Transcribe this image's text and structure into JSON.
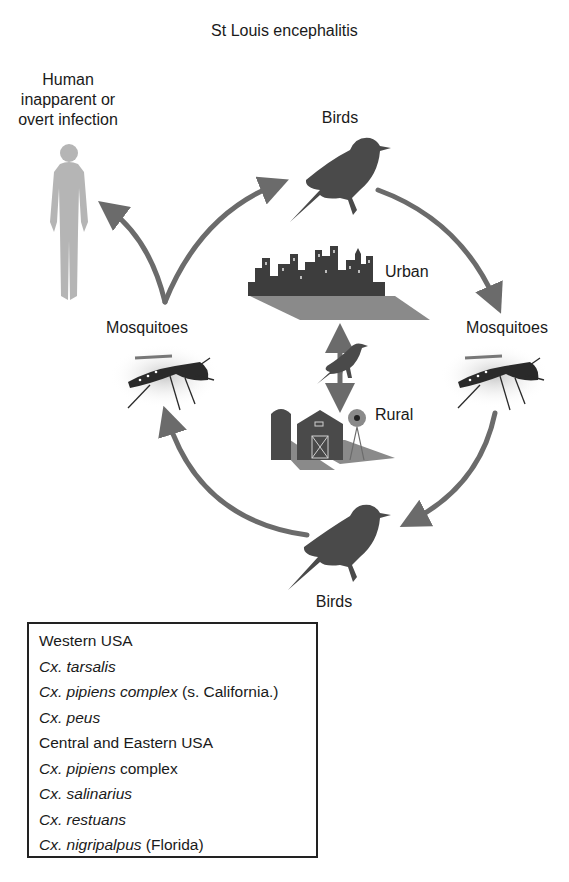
{
  "title": "St Louis encephalitis",
  "nodes": {
    "human": {
      "line1": "Human",
      "line2": "inapparent or",
      "line3": "overt infection"
    },
    "birds_top": "Birds",
    "birds_bottom": "Birds",
    "mosquitoes_left": "Mosquitoes",
    "mosquitoes_right": "Mosquitoes",
    "urban": "Urban",
    "rural": "Rural"
  },
  "colors": {
    "arrow": "#6b6b6b",
    "bird": "#4a4a4a",
    "human": "#b5b5b5",
    "box_border": "#222222"
  },
  "legend": {
    "lines": [
      {
        "italic": "",
        "plain": "Western USA"
      },
      {
        "italic": "Cx. tarsalis",
        "plain": ""
      },
      {
        "italic": "Cx. pipiens complex",
        "plain": " (s. California.)"
      },
      {
        "italic": "Cx. peus",
        "plain": ""
      },
      {
        "italic": "",
        "plain": "Central and Eastern USA"
      },
      {
        "italic": "Cx. pipiens",
        "plain": " complex"
      },
      {
        "italic": "Cx. salinarius",
        "plain": ""
      },
      {
        "italic": "Cx. restuans",
        "plain": ""
      },
      {
        "italic": "Cx. nigripalpus",
        "plain": " (Florida)"
      }
    ]
  }
}
